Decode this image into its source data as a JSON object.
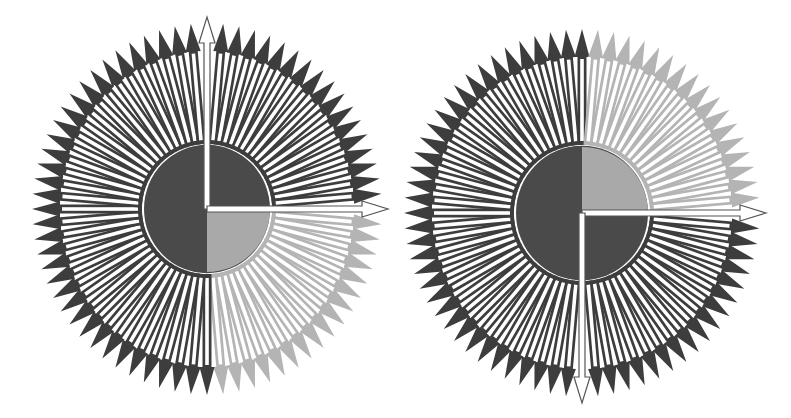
{
  "figure": {
    "background": "#ffffff",
    "arrow_count": 72,
    "angle_step_deg": 5,
    "colors": {
      "dark_arrow": "#3d3d3d",
      "light_arrow": "#b4b4b4",
      "shaft_fill": "#ffffff",
      "dark_disc": "#4a4a4a",
      "light_disc": "#a9a9a9",
      "highlight_outline": "#555555"
    },
    "panels": [
      {
        "id": "left",
        "cx": 207,
        "cy": 209,
        "rx": 175,
        "ry": 186,
        "disc_r": 63,
        "light_sector_deg": [
          0,
          90
        ],
        "highlight_arrows_deg": [
          270,
          0
        ],
        "highlight_from_center": true
      },
      {
        "id": "right",
        "cx": 582,
        "cy": 213,
        "rx": 178,
        "ry": 184,
        "disc_r": 66,
        "light_sector_deg": [
          270,
          360
        ],
        "highlight_arrows_deg": [
          0,
          90
        ],
        "highlight_from_center": true
      }
    ]
  }
}
